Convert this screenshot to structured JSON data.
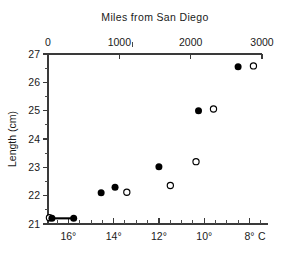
{
  "chart_data": {
    "type": "scatter",
    "title": "Miles from San Diego",
    "xlabel": "",
    "ylabel": "Length (cm)",
    "secondary_xlabel": "C",
    "grid": false,
    "legend_position": "none",
    "top_axis": {
      "label": "Miles from San Diego",
      "ticks": [
        0,
        1000,
        2000,
        3000
      ],
      "tick_labels": [
        "0",
        "1000",
        "2000",
        "3000"
      ],
      "range": [
        0,
        3000
      ]
    },
    "bottom_axis": {
      "ticks": [
        16,
        14,
        12,
        10,
        8
      ],
      "tick_labels": [
        "16°",
        "14°",
        "12°",
        "10°",
        "8°"
      ],
      "unit_label": "C",
      "range": [
        16.9,
        7.45
      ],
      "minor_ticks": [
        16.5,
        15.5,
        15,
        14.5,
        13.5,
        13,
        12.5,
        11.5,
        11,
        10.5,
        9.5,
        9,
        8.5,
        7.5
      ]
    },
    "y_axis": {
      "label": "Length (cm)",
      "ticks": [
        21,
        22,
        23,
        24,
        25,
        26,
        27
      ],
      "tick_labels": [
        "21",
        "22",
        "23",
        "24",
        "25",
        "26",
        "27"
      ],
      "minor_ticks": [
        21.5,
        22.5,
        23.5,
        24.5,
        25.5,
        26.5
      ],
      "ylim": [
        21,
        27
      ]
    },
    "series": [
      {
        "name": "filled",
        "marker": "filled-circle",
        "color": "#000000",
        "points": [
          {
            "x": 55,
            "y": 21.2
          },
          {
            "x": 360,
            "y": 21.2
          },
          {
            "x": 745,
            "y": 22.1
          },
          {
            "x": 940,
            "y": 22.3
          },
          {
            "x": 1555,
            "y": 23.02
          },
          {
            "x": 2110,
            "y": 25.0
          },
          {
            "x": 2665,
            "y": 26.55
          }
        ]
      },
      {
        "name": "open",
        "marker": "open-circle",
        "color": "#ffffff",
        "points": [
          {
            "x": 20,
            "y": 21.22
          },
          {
            "x": 1105,
            "y": 22.12
          },
          {
            "x": 1715,
            "y": 22.36
          },
          {
            "x": 2075,
            "y": 23.2
          },
          {
            "x": 2320,
            "y": 25.06
          },
          {
            "x": 2880,
            "y": 26.58
          }
        ]
      }
    ],
    "connectors": [
      {
        "x1": 55,
        "y1": 21.2,
        "x2": 360,
        "y2": 21.2
      }
    ]
  },
  "geometry": {
    "plot_left": 48,
    "plot_right": 262,
    "plot_top": 54,
    "plot_bottom": 224
  }
}
